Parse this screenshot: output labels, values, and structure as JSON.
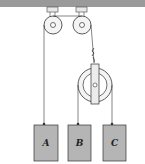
{
  "diagram": {
    "type": "pulley-system",
    "ceiling_color": "#9a9a9a",
    "block_color": "#b5b5b5",
    "line_color": "#333333",
    "blocks": [
      {
        "label": "A"
      },
      {
        "label": "B"
      },
      {
        "label": "C"
      }
    ],
    "fixed_pulleys": 2,
    "movable_pulleys": 1
  }
}
